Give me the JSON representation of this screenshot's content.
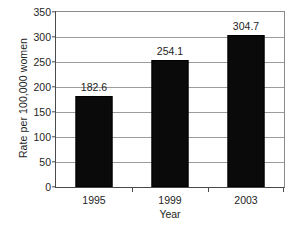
{
  "chart_data": {
    "type": "bar",
    "title": "",
    "xlabel": "Year",
    "ylabel": "Rate per 100,000 women",
    "categories": [
      "1995",
      "1999",
      "2003"
    ],
    "values": [
      182.6,
      254.1,
      304.7
    ],
    "value_labels": [
      "182.6",
      "254.1",
      "304.7"
    ],
    "ylim": [
      0,
      350
    ],
    "yticks": [
      0,
      50,
      100,
      150,
      200,
      250,
      300,
      350
    ],
    "ytick_labels": [
      "0",
      "50",
      "100",
      "150",
      "200",
      "250",
      "300",
      "350"
    ],
    "grid": "horizontal",
    "legend": "none",
    "bar_color": "#0a0a0a",
    "grid_color": "#9c9c9c",
    "axis_color": "#4a4a4a",
    "background": "#ffffff"
  }
}
